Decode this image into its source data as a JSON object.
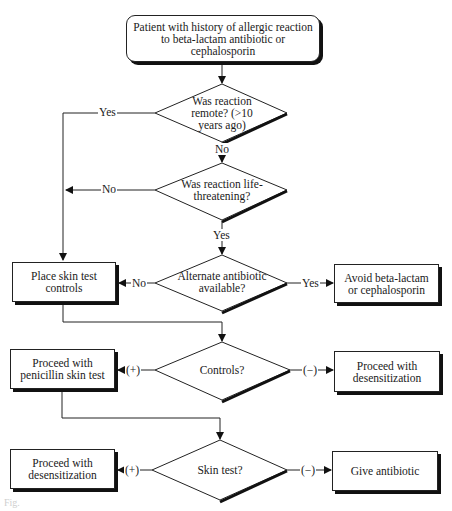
{
  "flowchart": {
    "start": "Patient with history of allergic reaction to beta-lactam antibiotic or cephalosporin",
    "decisions": {
      "remote": "Was reaction remote? (>10 years ago)",
      "life_threatening": "Was reaction life-threatening?",
      "alternate": "Alternate antibiotic available?",
      "controls": "Controls?",
      "skin_test": "Skin test?"
    },
    "actions": {
      "place_controls": "Place skin test controls",
      "avoid": "Avoid beta-lactam or cephalosporin",
      "penicillin_test": "Proceed with penicillin skin test",
      "desens_controls": "Proceed with desensitization",
      "desens_skin": "Proceed with desensitization",
      "give_antibiotic": "Give antibiotic"
    },
    "edge_labels": {
      "remote_yes": "Yes",
      "remote_no": "No",
      "life_no": "No",
      "life_yes": "Yes",
      "alt_no": "No",
      "alt_yes": "Yes",
      "controls_pos": "(+)",
      "controls_neg": "(−)",
      "skin_pos": "(+)",
      "skin_neg": "(−)"
    },
    "figure_label": "Fig."
  }
}
